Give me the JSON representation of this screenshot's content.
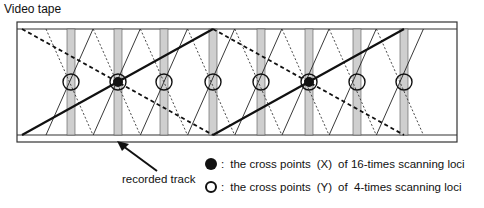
{
  "title": "Video tape",
  "arrow_label": "recorded track",
  "legend": [
    {
      "symbol": "filled-circle",
      "colon": ":",
      "text_before": "the cross points",
      "marker": "(X)",
      "text_after": "of 16-times scanning loci"
    },
    {
      "symbol": "open-circle",
      "colon": ":",
      "text_before": "the cross points",
      "marker": "(Y)",
      "text_after": "of  4-times scanning loci"
    }
  ],
  "colors": {
    "line": "#111111",
    "track_fill": "#cfcfcf",
    "background": "#ffffff"
  },
  "diagram": {
    "tape": {
      "x": 17,
      "y": 22,
      "w": 440,
      "h": 120,
      "inner_top": 29,
      "inner_bottom": 135
    },
    "track_centers": [
      71,
      118,
      164,
      213,
      261,
      309,
      357,
      404
    ],
    "cross_y": 82,
    "filled_cross_indices": [
      1,
      5
    ]
  }
}
